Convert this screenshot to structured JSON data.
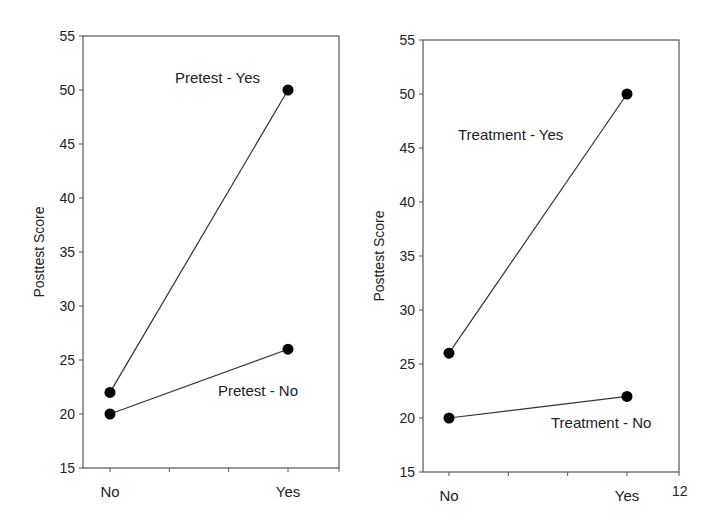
{
  "chart_data": [
    {
      "type": "line",
      "title": "",
      "xlabel": "",
      "ylabel": "Posttest Score",
      "categories": [
        "No",
        "Yes"
      ],
      "ylim": [
        15,
        55
      ],
      "yticks": [
        15,
        20,
        25,
        30,
        35,
        40,
        45,
        50,
        55
      ],
      "grid": false,
      "legend": "inline labels",
      "series": [
        {
          "name": "Pretest - Yes",
          "values": [
            22,
            50
          ]
        },
        {
          "name": "Pretest - No",
          "values": [
            20,
            26
          ]
        }
      ]
    },
    {
      "type": "line",
      "title": "",
      "xlabel": "",
      "ylabel": "Posttest Score",
      "categories": [
        "No",
        "Yes"
      ],
      "ylim": [
        15,
        55
      ],
      "yticks": [
        15,
        20,
        25,
        30,
        35,
        40,
        45,
        50,
        55
      ],
      "grid": false,
      "legend": "inline labels",
      "series": [
        {
          "name": "Treatment - Yes",
          "values": [
            26,
            50
          ]
        },
        {
          "name": "Treatment - No",
          "values": [
            20,
            22
          ]
        }
      ]
    }
  ],
  "page_number": "12"
}
